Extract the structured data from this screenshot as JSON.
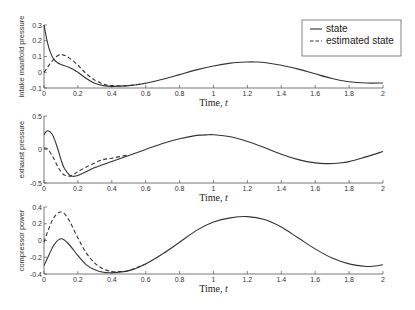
{
  "chart_data": [
    {
      "type": "line",
      "title": "",
      "xlabel": "Time, t",
      "ylabel": "intake manifold pressure",
      "xlim": [
        0,
        2
      ],
      "ylim": [
        -0.1,
        0.3
      ],
      "xticks": [
        "0",
        "0.2",
        "0.4",
        "0.6",
        "0.8",
        "1",
        "1.2",
        "1.4",
        "1.6",
        "1.8",
        "2"
      ],
      "yticks": [
        "-0.1",
        "0",
        "0.1",
        "0.2",
        "0.3"
      ],
      "grid": false,
      "series": [
        {
          "name": "state",
          "style": "solid",
          "x": [
            0,
            0.02,
            0.04,
            0.06,
            0.08,
            0.1,
            0.15,
            0.2,
            0.25,
            0.3,
            0.35,
            0.4,
            0.5,
            0.6,
            0.7,
            0.8,
            0.9,
            1.0,
            1.1,
            1.2,
            1.25,
            1.3,
            1.4,
            1.5,
            1.6,
            1.7,
            1.8,
            1.9,
            2.0
          ],
          "y": [
            0.3,
            0.19,
            0.12,
            0.08,
            0.06,
            0.05,
            0.03,
            0.0,
            -0.04,
            -0.07,
            -0.085,
            -0.09,
            -0.085,
            -0.07,
            -0.045,
            -0.015,
            0.015,
            0.04,
            0.058,
            0.065,
            0.065,
            0.062,
            0.045,
            0.02,
            -0.01,
            -0.04,
            -0.06,
            -0.068,
            -0.068
          ]
        },
        {
          "name": "estimated state",
          "style": "dashed",
          "x": [
            0,
            0.02,
            0.04,
            0.06,
            0.08,
            0.1,
            0.12,
            0.15,
            0.2,
            0.25,
            0.3,
            0.35,
            0.4,
            0.5,
            0.6
          ],
          "y": [
            0.0,
            0.03,
            0.06,
            0.085,
            0.105,
            0.112,
            0.108,
            0.09,
            0.045,
            -0.01,
            -0.05,
            -0.075,
            -0.085,
            -0.085,
            -0.07
          ]
        }
      ],
      "legend": {
        "position": "upper right",
        "entries": [
          "state",
          "estimated state"
        ]
      }
    },
    {
      "type": "line",
      "title": "",
      "xlabel": "Time, t",
      "ylabel": "exhaust pressure",
      "xlim": [
        0,
        2
      ],
      "ylim": [
        -0.5,
        0.5
      ],
      "xticks": [
        "0",
        "0.2",
        "0.4",
        "0.6",
        "0.8",
        "1",
        "1.2",
        "1.4",
        "1.6",
        "1.8",
        "2"
      ],
      "yticks": [
        "-0.5",
        "0",
        "0.5"
      ],
      "grid": false,
      "series": [
        {
          "name": "state",
          "style": "solid",
          "x": [
            0,
            0.02,
            0.05,
            0.08,
            0.1,
            0.12,
            0.15,
            0.17,
            0.2,
            0.25,
            0.3,
            0.4,
            0.5,
            0.6,
            0.7,
            0.8,
            0.9,
            0.97,
            1.0,
            1.1,
            1.2,
            1.3,
            1.4,
            1.5,
            1.6,
            1.68,
            1.75,
            1.8,
            1.9,
            2.0
          ],
          "y": [
            0.22,
            0.28,
            0.22,
            0.02,
            -0.15,
            -0.28,
            -0.38,
            -0.4,
            -0.39,
            -0.33,
            -0.27,
            -0.18,
            -0.09,
            0.0,
            0.09,
            0.16,
            0.21,
            0.22,
            0.22,
            0.19,
            0.12,
            0.03,
            -0.07,
            -0.15,
            -0.2,
            -0.21,
            -0.2,
            -0.18,
            -0.11,
            -0.03
          ]
        },
        {
          "name": "estimated state",
          "style": "dashed",
          "x": [
            0,
            0.02,
            0.05,
            0.08,
            0.1,
            0.12,
            0.15,
            0.17,
            0.2,
            0.25,
            0.3,
            0.35,
            0.4,
            0.5
          ],
          "y": [
            0.02,
            0.01,
            -0.1,
            -0.25,
            -0.33,
            -0.38,
            -0.4,
            -0.38,
            -0.33,
            -0.26,
            -0.2,
            -0.15,
            -0.13,
            -0.08
          ]
        }
      ]
    },
    {
      "type": "line",
      "title": "",
      "xlabel": "Time, t",
      "ylabel": "compressor power",
      "xlim": [
        0,
        2
      ],
      "ylim": [
        -0.4,
        0.4
      ],
      "xticks": [
        "0",
        "0.2",
        "0.4",
        "0.6",
        "0.8",
        "1",
        "1.2",
        "1.4",
        "1.6",
        "1.8",
        "2"
      ],
      "yticks": [
        "-0.4",
        "-0.2",
        "0",
        "0.2",
        "0.4"
      ],
      "grid": false,
      "series": [
        {
          "name": "state",
          "style": "solid",
          "x": [
            0,
            0.03,
            0.06,
            0.1,
            0.14,
            0.2,
            0.25,
            0.3,
            0.35,
            0.4,
            0.5,
            0.6,
            0.7,
            0.8,
            0.9,
            1.0,
            1.1,
            1.2,
            1.3,
            1.4,
            1.5,
            1.6,
            1.7,
            1.8,
            1.9,
            1.95,
            2.0
          ],
          "y": [
            -0.3,
            -0.17,
            -0.05,
            0.02,
            -0.03,
            -0.18,
            -0.29,
            -0.35,
            -0.38,
            -0.385,
            -0.36,
            -0.28,
            -0.16,
            -0.02,
            0.12,
            0.22,
            0.27,
            0.285,
            0.25,
            0.16,
            0.03,
            -0.1,
            -0.21,
            -0.28,
            -0.31,
            -0.305,
            -0.29
          ]
        },
        {
          "name": "estimated state",
          "style": "dashed",
          "x": [
            0,
            0.03,
            0.06,
            0.1,
            0.14,
            0.2,
            0.25,
            0.3,
            0.35,
            0.4,
            0.45,
            0.5,
            0.6
          ],
          "y": [
            -0.02,
            0.15,
            0.28,
            0.34,
            0.27,
            0.03,
            -0.15,
            -0.27,
            -0.34,
            -0.37,
            -0.37,
            -0.36,
            -0.28
          ]
        }
      ]
    }
  ],
  "legend": {
    "items": [
      {
        "label": "state",
        "style": "solid"
      },
      {
        "label": "estimated state",
        "style": "dashed"
      }
    ]
  },
  "plots": [
    {
      "ylabel": "intake manifold pressure",
      "xlabel": "Time, t"
    },
    {
      "ylabel": "exhaust pressure",
      "xlabel": "Time, t"
    },
    {
      "ylabel": "compressor power",
      "xlabel": "Time, t"
    }
  ],
  "colors": {
    "line": "#333333",
    "axis": "#555555"
  }
}
